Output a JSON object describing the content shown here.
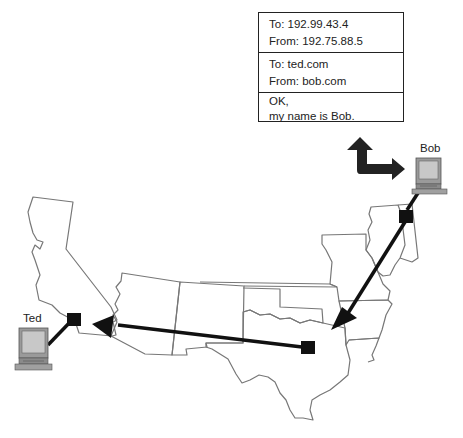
{
  "packet": {
    "ip_header": {
      "to": "To: 192.99.43.4",
      "from": "From: 192.75.88.5"
    },
    "app_header": {
      "to": "To: ted.com",
      "from": "From: bob.com"
    },
    "payload": {
      "line1": "OK,",
      "line2": "my name is Bob."
    }
  },
  "hosts": {
    "bob": {
      "label": "Bob"
    },
    "ted": {
      "label": "Ted"
    }
  },
  "colors": {
    "line": "#111111",
    "state_border": "#777777",
    "monitor_gray": "#9a9a9a",
    "screen_gray": "#c8c8c8"
  }
}
